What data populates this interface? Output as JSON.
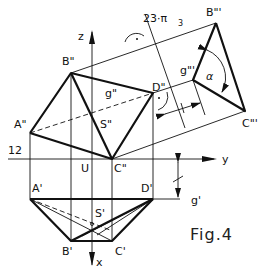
{
  "figure": {
    "caption": "Fig.4",
    "title_annotation": "23·π₃",
    "title_main": "23·π",
    "title_sub": "3",
    "axis_labels": {
      "z": "z",
      "y": "y",
      "x": "x",
      "x12": "12",
      "U": "U"
    },
    "points_front": {
      "A": "A\"",
      "B": "B\"",
      "C": "C\"",
      "D": "D\"",
      "S": "S\"",
      "g": "g\""
    },
    "points_top": {
      "A": "A'",
      "B": "B'",
      "C": "C'",
      "D": "D'",
      "S": "S'",
      "g": "g'"
    },
    "points_aux": {
      "B": "B\"'",
      "C": "C\"'",
      "g": "g\"'"
    },
    "angle_label": "α",
    "distance_mark": "+",
    "colors": {
      "line": "#111111",
      "background": "#ffffff"
    }
  }
}
